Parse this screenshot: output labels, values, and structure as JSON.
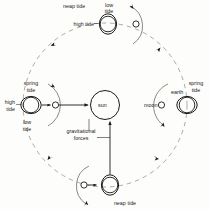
{
  "diagram": {
    "background_color": "#fdfdfb",
    "stroke_color": "#1a1a1a",
    "orbit_color": "#8c8c8c",
    "bodies": {
      "sun_label": "sun",
      "moon_label": "moon",
      "earth_label": "earth"
    },
    "force_label_line1": "gravitational",
    "force_label_line2": "forces",
    "positions": {
      "top": {
        "name": "neap-tide-top",
        "tide_type": "neap tide",
        "bulge_label_1": "low\ntide",
        "bulge_label_2": "high tide",
        "low_tide": "low",
        "low_tide2": "tide",
        "high_tide": "high tide"
      },
      "left": {
        "name": "spring-tide-left",
        "tide_type_1": "spring",
        "tide_type_2": "tide",
        "high_1": "high",
        "high_2": "tide",
        "low_1": "low",
        "low_2": "tide"
      },
      "right": {
        "name": "spring-tide-right",
        "tide_type_1": "spring",
        "tide_type_2": "tide"
      },
      "bottom": {
        "name": "neap-tide-bottom",
        "tide_type": "neap tide"
      }
    }
  }
}
